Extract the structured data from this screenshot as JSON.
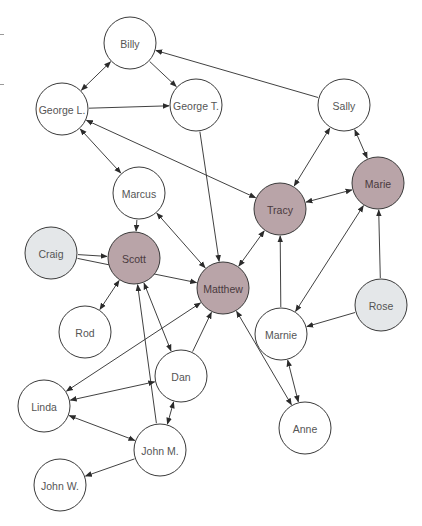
{
  "diagram": {
    "type": "directed-social-network",
    "node_radius": 26,
    "colors": {
      "default_fill": "#ffffff",
      "highlight_fill": "#b9a4a8",
      "secondary_fill": "#e4e7e9",
      "stroke": "#3a3a3a",
      "edge": "#2b2b2b"
    },
    "nodes": [
      {
        "id": "billy",
        "label": "Billy",
        "x": 130,
        "y": 43,
        "style": "default"
      },
      {
        "id": "georgeL",
        "label": "George L.",
        "x": 62,
        "y": 109,
        "style": "default"
      },
      {
        "id": "georgeT",
        "label": "George T.",
        "x": 196,
        "y": 105,
        "style": "default"
      },
      {
        "id": "sally",
        "label": "Sally",
        "x": 344,
        "y": 105,
        "style": "default"
      },
      {
        "id": "marcus",
        "label": "Marcus",
        "x": 139,
        "y": 193,
        "style": "default"
      },
      {
        "id": "tracy",
        "label": "Tracy",
        "x": 280,
        "y": 209,
        "style": "highlight"
      },
      {
        "id": "marie",
        "label": "Marie",
        "x": 378,
        "y": 183,
        "style": "highlight"
      },
      {
        "id": "craig",
        "label": "Craig",
        "x": 51,
        "y": 253,
        "style": "secondary"
      },
      {
        "id": "scott",
        "label": "Scott",
        "x": 134,
        "y": 258,
        "style": "highlight"
      },
      {
        "id": "matthew",
        "label": "Matthew",
        "x": 223,
        "y": 288,
        "style": "highlight"
      },
      {
        "id": "rose",
        "label": "Rose",
        "x": 381,
        "y": 305,
        "style": "secondary"
      },
      {
        "id": "marnie",
        "label": "Marnie",
        "x": 281,
        "y": 334,
        "style": "default"
      },
      {
        "id": "rod",
        "label": "Rod",
        "x": 85,
        "y": 332,
        "style": "default"
      },
      {
        "id": "dan",
        "label": "Dan",
        "x": 181,
        "y": 376,
        "style": "default"
      },
      {
        "id": "linda",
        "label": "Linda",
        "x": 44,
        "y": 406,
        "style": "default"
      },
      {
        "id": "johnM",
        "label": "John M.",
        "x": 160,
        "y": 450,
        "style": "default"
      },
      {
        "id": "anne",
        "label": "Anne",
        "x": 305,
        "y": 428,
        "style": "default"
      },
      {
        "id": "johnW",
        "label": "John W.",
        "x": 60,
        "y": 485,
        "style": "default"
      }
    ],
    "edges": [
      {
        "from": "billy",
        "to": "georgeL",
        "bidirectional": true
      },
      {
        "from": "billy",
        "to": "georgeT",
        "bidirectional": false
      },
      {
        "from": "sally",
        "to": "billy",
        "bidirectional": false
      },
      {
        "from": "georgeL",
        "to": "georgeT",
        "bidirectional": false
      },
      {
        "from": "georgeL",
        "to": "marcus",
        "bidirectional": true
      },
      {
        "from": "tracy",
        "to": "georgeL",
        "bidirectional": true
      },
      {
        "from": "georgeT",
        "to": "matthew",
        "bidirectional": false
      },
      {
        "from": "tracy",
        "to": "sally",
        "bidirectional": true
      },
      {
        "from": "sally",
        "to": "marie",
        "bidirectional": true
      },
      {
        "from": "marie",
        "to": "tracy",
        "bidirectional": true
      },
      {
        "from": "marcus",
        "to": "scott",
        "bidirectional": false
      },
      {
        "from": "marcus",
        "to": "matthew",
        "bidirectional": true
      },
      {
        "from": "tracy",
        "to": "matthew",
        "bidirectional": true
      },
      {
        "from": "craig",
        "to": "scott",
        "bidirectional": false
      },
      {
        "from": "craig",
        "to": "matthew",
        "bidirectional": false
      },
      {
        "from": "scott",
        "to": "rod",
        "bidirectional": true
      },
      {
        "from": "scott",
        "to": "dan",
        "bidirectional": true
      },
      {
        "from": "johnM",
        "to": "scott",
        "bidirectional": false
      },
      {
        "from": "matthew",
        "to": "linda",
        "bidirectional": true
      },
      {
        "from": "dan",
        "to": "matthew",
        "bidirectional": false
      },
      {
        "from": "anne",
        "to": "matthew",
        "bidirectional": true
      },
      {
        "from": "marnie",
        "to": "tracy",
        "bidirectional": false
      },
      {
        "from": "marnie",
        "to": "marie",
        "bidirectional": true
      },
      {
        "from": "rose",
        "to": "marie",
        "bidirectional": false
      },
      {
        "from": "rose",
        "to": "marnie",
        "bidirectional": false
      },
      {
        "from": "marnie",
        "to": "anne",
        "bidirectional": true
      },
      {
        "from": "dan",
        "to": "linda",
        "bidirectional": true
      },
      {
        "from": "dan",
        "to": "johnM",
        "bidirectional": true
      },
      {
        "from": "linda",
        "to": "johnM",
        "bidirectional": true
      },
      {
        "from": "johnM",
        "to": "johnW",
        "bidirectional": false
      }
    ]
  }
}
